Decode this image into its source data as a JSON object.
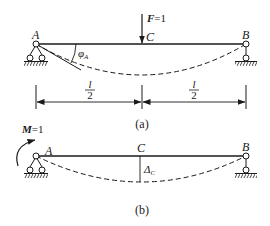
{
  "figure_a": {
    "caption": "(a)",
    "point_a": "A",
    "point_b": "B",
    "point_c": "C",
    "force_symbol": "F",
    "force_value": "=1",
    "angle_symbol": "φ",
    "angle_subscript": "A",
    "dim_left_num": "l",
    "dim_left_den": "2",
    "dim_right_num": "l",
    "dim_right_den": "2"
  },
  "figure_b": {
    "caption": "(b)",
    "point_a": "A",
    "point_b": "B",
    "point_c": "C",
    "moment_symbol": "M",
    "moment_value": "=1",
    "deflection_symbol": "Δ",
    "deflection_subscript": "C"
  },
  "colors": {
    "line": "#1a1a1a",
    "background": "#ffffff"
  }
}
